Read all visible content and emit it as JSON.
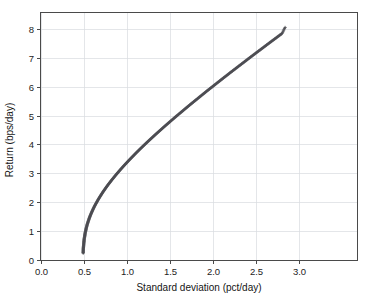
{
  "chart_data": {
    "type": "scatter",
    "title": "",
    "xlabel": "Standard deviation (pct/day)",
    "ylabel": "Return (bps/day)",
    "xlim": [
      0.0,
      3.67
    ],
    "ylim": [
      0.0,
      8.55
    ],
    "xticks": [
      "0.0",
      "0.5",
      "1.0",
      "1.5",
      "2.0",
      "2.5",
      "3.0"
    ],
    "xtick_values": [
      0.0,
      0.5,
      1.0,
      1.5,
      2.0,
      2.5,
      3.0
    ],
    "yticks": [
      "0",
      "1",
      "2",
      "3",
      "4",
      "5",
      "6",
      "7",
      "8"
    ],
    "ytick_values": [
      0,
      1,
      2,
      3,
      4,
      5,
      6,
      7,
      8
    ],
    "grid": true,
    "legend": "none",
    "marker": "plus",
    "series": [
      {
        "name": "efficient-frontier",
        "color": "#4d4d53",
        "x": [
          0.49,
          0.491,
          0.492,
          0.494,
          0.496,
          0.499,
          0.502,
          0.506,
          0.51,
          0.515,
          0.521,
          0.527,
          0.534,
          0.542,
          0.551,
          0.56,
          0.57,
          0.581,
          0.593,
          0.605,
          0.618,
          0.632,
          0.647,
          0.662,
          0.678,
          0.695,
          0.712,
          0.73,
          0.749,
          0.768,
          0.788,
          0.809,
          0.83,
          0.852,
          0.874,
          0.897,
          0.92,
          0.944,
          0.968,
          0.993,
          1.018,
          1.044,
          1.07,
          1.096,
          1.123,
          1.15,
          1.178,
          1.206,
          1.234,
          1.263,
          1.292,
          1.321,
          1.351,
          1.381,
          1.411,
          1.441,
          1.472,
          1.503,
          1.534,
          1.565,
          1.597,
          1.629,
          1.661,
          1.693,
          1.725,
          1.758,
          1.791,
          1.824,
          1.857,
          1.89,
          1.923,
          1.957,
          1.991,
          2.025,
          2.059,
          2.093,
          2.127,
          2.162,
          2.196,
          2.231,
          2.266,
          2.301,
          2.336,
          2.371,
          2.406,
          2.441,
          2.477,
          2.512,
          2.548,
          2.584,
          2.619,
          2.655,
          2.691,
          2.727,
          2.763,
          2.799,
          2.835
        ],
        "y": [
          0.24,
          0.32,
          0.4,
          0.48,
          0.56,
          0.64,
          0.72,
          0.8,
          0.88,
          0.96,
          1.04,
          1.12,
          1.2,
          1.28,
          1.36,
          1.44,
          1.52,
          1.6,
          1.68,
          1.76,
          1.84,
          1.92,
          2.0,
          2.08,
          2.16,
          2.24,
          2.32,
          2.4,
          2.48,
          2.56,
          2.64,
          2.72,
          2.8,
          2.88,
          2.96,
          3.04,
          3.12,
          3.2,
          3.28,
          3.36,
          3.44,
          3.52,
          3.6,
          3.68,
          3.76,
          3.84,
          3.92,
          4.0,
          4.08,
          4.16,
          4.24,
          4.32,
          4.4,
          4.48,
          4.56,
          4.64,
          4.72,
          4.8,
          4.88,
          4.96,
          5.04,
          5.12,
          5.2,
          5.28,
          5.36,
          5.44,
          5.52,
          5.6,
          5.68,
          5.76,
          5.84,
          5.92,
          6.0,
          6.08,
          6.16,
          6.24,
          6.32,
          6.4,
          6.48,
          6.56,
          6.64,
          6.72,
          6.8,
          6.88,
          6.96,
          7.04,
          7.12,
          7.2,
          7.28,
          7.36,
          7.44,
          7.52,
          7.6,
          7.68,
          7.76,
          7.84,
          8.05
        ]
      }
    ]
  }
}
